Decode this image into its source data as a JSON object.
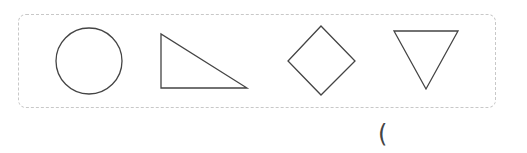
{
  "figure": {
    "shapes": [
      {
        "name": "circle",
        "type": "circle",
        "cx": 89,
        "cy": 61,
        "r": 33
      },
      {
        "name": "right-triangle",
        "type": "polygon",
        "points": "161,34 161,88 247,88"
      },
      {
        "name": "diamond",
        "type": "polygon",
        "points": "321,26 355,61 321,95 288,61"
      },
      {
        "name": "inverted-triangle",
        "type": "polygon",
        "points": "394,31 458,31 426,89"
      }
    ],
    "stroke_color": "#444444",
    "frame_border_color": "#c8c8c8"
  },
  "answer": {
    "bracket_text": "("
  }
}
